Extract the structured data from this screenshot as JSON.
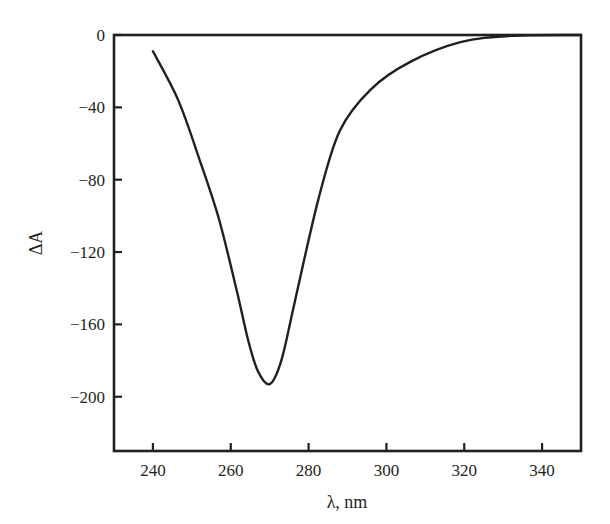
{
  "chart_data": {
    "type": "line",
    "title": "",
    "xlabel": "λ, nm",
    "ylabel": "ΔA",
    "xlim": [
      230,
      350
    ],
    "ylim": [
      -230,
      0
    ],
    "xticks": [
      240,
      260,
      280,
      300,
      320,
      340
    ],
    "yticks": [
      0,
      -40,
      -80,
      -120,
      -160,
      -200
    ],
    "xtick_labels": [
      "240",
      "260",
      "280",
      "300",
      "320",
      "340"
    ],
    "ytick_labels": [
      "0",
      "−40",
      "−80",
      "−120",
      "−160",
      "−200"
    ],
    "grid": false,
    "legend": null,
    "series": [
      {
        "name": "ΔA spectrum",
        "color": "#231f20",
        "x": [
          240,
          246.5,
          252,
          257,
          261.5,
          264.5,
          267,
          270,
          273,
          276.5,
          282.5,
          288,
          296,
          306,
          319,
          332,
          350
        ],
        "y": [
          -9,
          -36,
          -69,
          -102,
          -141,
          -169,
          -186,
          -193,
          -180,
          -147,
          -91,
          -53,
          -30,
          -15,
          -4,
          -0.5,
          0
        ]
      }
    ]
  }
}
